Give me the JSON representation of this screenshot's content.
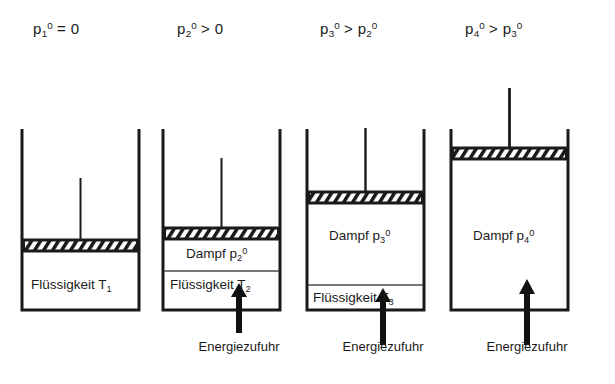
{
  "figure": {
    "caption_present": false,
    "background_color": "#ffffff",
    "line_color": "#1a1a1a"
  },
  "pressure_labels": [
    {
      "text": "p₁⁰ = 0",
      "base": "p",
      "sub": "1",
      "sup": "0",
      "relation": "=",
      "rhs": "0"
    },
    {
      "text": "p₂⁰ > 0",
      "base": "p",
      "sub": "2",
      "sup": "0",
      "relation": ">",
      "rhs": "0"
    },
    {
      "text": "p₃⁰ > p₂⁰",
      "base": "p",
      "sub": "3",
      "sup": "0",
      "relation": ">",
      "rhs": "p₂⁰"
    },
    {
      "text": "p₄⁰ > p₃⁰",
      "base": "p",
      "sub": "4",
      "sup": "0",
      "relation": ">",
      "rhs": "p₃⁰"
    }
  ],
  "stages": [
    {
      "id": "stage-1",
      "liquid_label": "Flüssigkeit T",
      "liquid_sub": "1",
      "vapor_label": null,
      "vapor_sub": null,
      "vapor_sup": null,
      "energy_label": null,
      "has_energy_arrow": false,
      "has_vapor": false
    },
    {
      "id": "stage-2",
      "liquid_label": "Flüssigkeit T",
      "liquid_sub": "2",
      "vapor_label": "Dampf p",
      "vapor_sub": "2",
      "vapor_sup": "0",
      "energy_label": "Energiezufuhr",
      "has_energy_arrow": true,
      "has_vapor": true
    },
    {
      "id": "stage-3",
      "liquid_label": "Flüssigkeit T",
      "liquid_sub": "3",
      "vapor_label": "Dampf p",
      "vapor_sub": "3",
      "vapor_sup": "0",
      "energy_label": "Energiezufuhr",
      "has_energy_arrow": true,
      "has_vapor": true
    },
    {
      "id": "stage-4",
      "liquid_label": null,
      "liquid_sub": null,
      "vapor_label": "Dampf p",
      "vapor_sub": "4",
      "vapor_sup": "0",
      "energy_label": "Energiezufuhr",
      "has_energy_arrow": true,
      "has_vapor": true
    }
  ]
}
